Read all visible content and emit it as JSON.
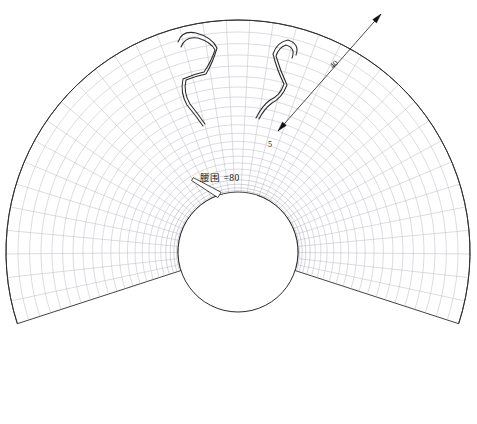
{
  "drawing": {
    "type": "pattern-draft",
    "title": "circular-skirt-pattern",
    "description": "CAD flat pattern draft of a circle skirt: annular sector with polar construction grid, inner waist circle, two serpentine ribbon details at the top opening, and radial dimension callouts.",
    "background_color": "#ffffff",
    "outline_color": "#2b2b2b",
    "grid_color": "#b9b9c4",
    "grid_color_dense": "#a9a9b6",
    "annotation_color": "#1a1a1a",
    "arrow_color": "#111111"
  },
  "geometry": {
    "center_x": 238,
    "center_y": 252,
    "inner_radius": 60,
    "outer_radius": 232,
    "sector_start_angle_deg": -108,
    "sector_end_angle_deg": 108,
    "sector_sweep_deg": 216,
    "radial_line_count": 37,
    "arc_ring_count": 22,
    "gap_opening_deg": 36
  },
  "annotations": {
    "waist": {
      "name": "waist-circumference",
      "text": "腰围 =80",
      "value": "80",
      "x": 200,
      "y": 170
    },
    "radius": {
      "name": "skirt-length-dimension",
      "text": "40",
      "value": "40",
      "x": 330,
      "y": 60,
      "rotation_deg": -46
    },
    "seam": {
      "name": "seam-allowance-dimension",
      "text": "5",
      "value": "5",
      "x": 268,
      "y": 140
    }
  },
  "dimension_lines": [
    {
      "name": "radius-dimension-line",
      "label": "40",
      "from_x": 278,
      "from_y": 131,
      "to_x": 381,
      "to_y": 14,
      "arrow_start": true,
      "arrow_end": true
    }
  ],
  "ribbons": [
    {
      "name": "left-ribbon-detail",
      "side": "left"
    },
    {
      "name": "right-ribbon-detail",
      "side": "right"
    }
  ],
  "icons": {
    "arrow_start": "arrow-head-icon",
    "arrow_end": "arrow-head-icon"
  }
}
